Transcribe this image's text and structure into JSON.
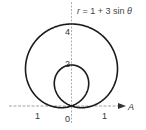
{
  "equation": {
    "r": "r",
    "rest": " = 1 + 3 sin ",
    "theta": "θ"
  },
  "axis": {
    "label": "A",
    "origin_label": "0",
    "tick_left": "1",
    "tick_right": "1",
    "tick_2": "2",
    "tick_4": "4"
  },
  "colors": {
    "curve": "#1a1a1a",
    "axis": "#888888"
  }
}
